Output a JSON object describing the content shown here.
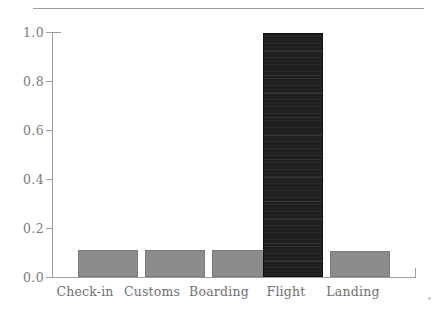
{
  "chart_data": {
    "type": "bar",
    "title": "",
    "subtitle": "",
    "xlabel": "",
    "ylabel": "",
    "categories": [
      "Check-in",
      "Customs",
      "Boarding",
      "Flight",
      "Landing"
    ],
    "values": [
      0.11,
      0.11,
      0.11,
      1.0,
      0.105
    ],
    "series": [
      {
        "name": "",
        "values": [
          0.11,
          0.11,
          0.11,
          1.0,
          0.105
        ]
      }
    ],
    "ylim": [
      0.0,
      1.0
    ],
    "yticks": [
      "0.0",
      "0.2",
      "0.4",
      "0.6",
      "0.8",
      "1.0"
    ],
    "ytick_values": [
      0.0,
      0.2,
      0.4,
      0.6,
      0.8,
      1.0
    ],
    "grid": false,
    "legend": null,
    "bar_colors": [
      "#8c8c8c",
      "#8c8c8c",
      "#8c8c8c",
      "#201f1f",
      "#8c8c8c"
    ],
    "highlight_category": "Flight",
    "axis_color": "#9d9d9d",
    "tick_label_color": "#7c7c7c",
    "background": "#ffffff"
  },
  "decor": {
    "top_rule": "horizontal-rule"
  }
}
